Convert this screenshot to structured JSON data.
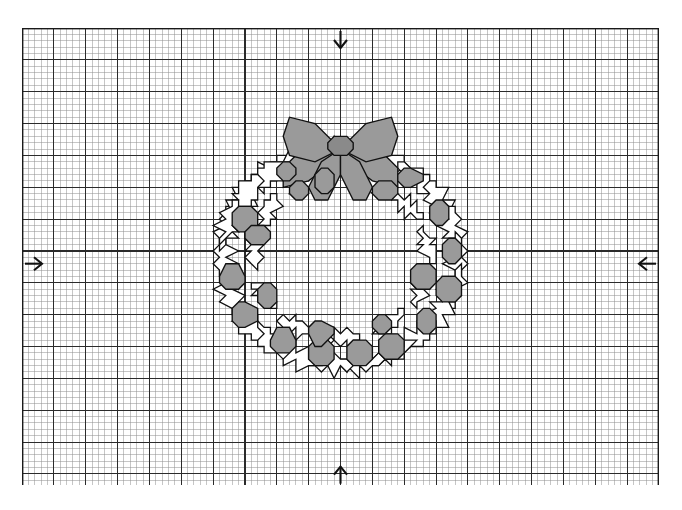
{
  "document": {
    "type": "cross-stitch-chart",
    "title": "Christmas Wreath Cross-Stitch Chart",
    "description": "Counted cross-stitch grid chart showing a holly wreath with a bow at the top and scattered berries."
  },
  "grid": {
    "columns": 100,
    "rows": 72,
    "cell_px": 6.37,
    "major_every": 5,
    "origin_x_px": 22,
    "origin_y_px": 28,
    "minor_color": "#8d8d8d",
    "major_color": "#2b2b2b",
    "border_color": "#1a1a1a",
    "background": "#ffffff",
    "minor_width": 0.5,
    "major_width": 1.1,
    "border_width": 1.4
  },
  "center_markers": [
    {
      "name": "top-center-marker",
      "side": "top",
      "glyph": "arrow-down",
      "col": 50
    },
    {
      "name": "bottom-center-marker",
      "side": "bottom",
      "glyph": "arrow-up",
      "col": 50
    },
    {
      "name": "left-center-marker",
      "side": "left",
      "glyph": "arrow-right",
      "row": 37
    },
    {
      "name": "right-center-marker",
      "side": "right",
      "glyph": "arrow-left",
      "row": 37
    }
  ],
  "palette": {
    "outline": "#111111",
    "fill_gray": "#9a9a9a",
    "fill_gray_dark": "#8a8a8a",
    "fill_white": "#ffffff",
    "paper": "#ffffff"
  },
  "motif": {
    "name": "holly-wreath-with-bow",
    "bounds_cells": {
      "x": 27,
      "y": 15,
      "w": 46,
      "h": 42
    },
    "stitch_unit_px": 6.37,
    "symmetry": "left-right mirrored about column 50",
    "legend_note": "Shaded cells = filled floss colour; outlined cells = second colour / backstitch outline."
  },
  "chart_data": {
    "type": "table",
    "grid_columns": 100,
    "grid_rows": 72,
    "filled_regions": 34,
    "outline_regions": 52,
    "colors_used": 2
  },
  "geometry": {
    "ring": {
      "cx": 50.0,
      "cy": 36.0,
      "outer_rx": 23.2,
      "outer_ry": 21.0,
      "inner_rx": 13.0,
      "inner_ry": 11.2
    },
    "leaves": [
      {
        "a": -96,
        "r": 18.4,
        "s": 5.6,
        "rot": -96,
        "fill": "white"
      },
      {
        "a": -80,
        "r": 18.6,
        "s": 5.2,
        "rot": -80,
        "fill": "white"
      },
      {
        "a": -64,
        "r": 18.4,
        "s": 5.6,
        "rot": -64,
        "fill": "white"
      },
      {
        "a": -48,
        "r": 18.2,
        "s": 5.8,
        "rot": -48,
        "fill": "white"
      },
      {
        "a": -32,
        "r": 18.4,
        "s": 5.6,
        "rot": -32,
        "fill": "white"
      },
      {
        "a": -16,
        "r": 18.4,
        "s": 5.6,
        "rot": -16,
        "fill": "white"
      },
      {
        "a": 0,
        "r": 18.4,
        "s": 5.8,
        "rot": 0,
        "fill": "white"
      },
      {
        "a": 16,
        "r": 18.4,
        "s": 5.6,
        "rot": 16,
        "fill": "white"
      },
      {
        "a": 32,
        "r": 18.4,
        "s": 5.6,
        "rot": 32,
        "fill": "white"
      },
      {
        "a": 48,
        "r": 18.2,
        "s": 5.8,
        "rot": 48,
        "fill": "white"
      },
      {
        "a": 64,
        "r": 18.4,
        "s": 5.6,
        "rot": 64,
        "fill": "white"
      },
      {
        "a": 80,
        "r": 18.6,
        "s": 5.4,
        "rot": 80,
        "fill": "white"
      },
      {
        "a": 96,
        "r": 18.4,
        "s": 5.6,
        "rot": 96,
        "fill": "white"
      },
      {
        "a": 112,
        "r": 18.4,
        "s": 5.6,
        "rot": 112,
        "fill": "white"
      },
      {
        "a": 128,
        "r": 18.2,
        "s": 5.8,
        "rot": 128,
        "fill": "white"
      },
      {
        "a": 144,
        "r": 18.4,
        "s": 5.6,
        "rot": 144,
        "fill": "white"
      },
      {
        "a": 160,
        "r": 18.4,
        "s": 5.6,
        "rot": 160,
        "fill": "white"
      },
      {
        "a": 180,
        "r": 18.4,
        "s": 5.8,
        "rot": 180,
        "fill": "white"
      },
      {
        "a": 196,
        "r": 18.4,
        "s": 5.6,
        "rot": 196,
        "fill": "white"
      },
      {
        "a": 212,
        "r": 18.2,
        "s": 5.8,
        "rot": 212,
        "fill": "white"
      },
      {
        "a": 228,
        "r": 18.4,
        "s": 5.6,
        "rot": 228,
        "fill": "white"
      },
      {
        "a": 244,
        "r": 18.6,
        "s": 5.4,
        "rot": 244,
        "fill": "white"
      },
      {
        "a": 260,
        "r": 18.4,
        "s": 5.6,
        "rot": 260,
        "fill": "white"
      },
      {
        "a": -112,
        "r": 18.4,
        "s": 5.4,
        "rot": -112,
        "fill": "white"
      },
      {
        "a": -128,
        "r": 18.2,
        "s": 5.6,
        "rot": -128,
        "fill": "white"
      },
      {
        "a": -144,
        "r": 18.4,
        "s": 5.6,
        "rot": -144,
        "fill": "white"
      },
      {
        "a": -160,
        "r": 18.4,
        "s": 5.6,
        "rot": -160,
        "fill": "white"
      }
    ],
    "inner_leaves": [
      {
        "a": -72,
        "r": 14.0,
        "s": 4.3,
        "rot": 100,
        "fill": "white"
      },
      {
        "a": -40,
        "r": 13.8,
        "s": 4.3,
        "rot": 130,
        "fill": "white"
      },
      {
        "a": -8,
        "r": 13.8,
        "s": 4.3,
        "rot": 160,
        "fill": "white"
      },
      {
        "a": 24,
        "r": 13.8,
        "s": 4.3,
        "rot": 200,
        "fill": "white"
      },
      {
        "a": 56,
        "r": 13.8,
        "s": 4.3,
        "rot": 230,
        "fill": "white"
      },
      {
        "a": 88,
        "r": 14.0,
        "s": 4.3,
        "rot": 260,
        "fill": "white"
      },
      {
        "a": 120,
        "r": 13.8,
        "s": 4.3,
        "rot": 290,
        "fill": "white"
      },
      {
        "a": 152,
        "r": 13.8,
        "s": 4.3,
        "rot": 320,
        "fill": "white"
      },
      {
        "a": 184,
        "r": 13.8,
        "s": 4.3,
        "rot": 350,
        "fill": "white"
      },
      {
        "a": 216,
        "r": 13.8,
        "s": 4.3,
        "rot": 20,
        "fill": "white"
      },
      {
        "a": 248,
        "r": 14.0,
        "s": 4.3,
        "rot": 50,
        "fill": "white"
      },
      {
        "a": -104,
        "r": 13.8,
        "s": 4.3,
        "rot": 70,
        "fill": "white"
      }
    ],
    "berries": [
      {
        "a": -120,
        "r": 17.2,
        "r2": 2.0
      },
      {
        "a": -100,
        "r": 13.6,
        "r2": 1.9
      },
      {
        "a": -60,
        "r": 13.6,
        "r2": 1.9
      },
      {
        "a": -120,
        "r": 13.2,
        "r2": 1.8
      },
      {
        "a": -156,
        "r": 16.4,
        "r2": 2.0
      },
      {
        "a": 168,
        "r": 17.6,
        "r2": 2.1
      },
      {
        "a": 148,
        "r": 18.2,
        "r2": 2.1
      },
      {
        "a": 122,
        "r": 17.4,
        "r2": 2.2
      },
      {
        "a": 100,
        "r": 17.0,
        "r2": 2.2
      },
      {
        "a": 80,
        "r": 17.2,
        "r2": 2.3
      },
      {
        "a": 62,
        "r": 17.4,
        "r2": 2.2
      },
      {
        "a": 40,
        "r": 17.6,
        "r2": 2.1
      },
      {
        "a": 18,
        "r": 17.8,
        "r2": 2.0
      },
      {
        "a": -4,
        "r": 17.6,
        "r2": 2.0
      },
      {
        "a": -26,
        "r": 17.2,
        "r2": 2.0
      },
      {
        "a": -52,
        "r": 17.4,
        "r2": 2.0
      },
      {
        "a": 14,
        "r": 13.4,
        "r2": 1.8
      },
      {
        "a": 60,
        "r": 13.2,
        "r2": 1.9
      },
      {
        "a": 104,
        "r": 13.4,
        "r2": 1.9
      },
      {
        "a": 150,
        "r": 13.4,
        "r2": 1.8
      },
      {
        "a": 196,
        "r": 13.6,
        "r2": 1.8
      }
    ],
    "bow": {
      "center": {
        "x": 50.0,
        "y": 18.5
      },
      "knot_r": 1.7,
      "left_loop": [
        [
          50,
          18.5
        ],
        [
          46.2,
          14.8
        ],
        [
          42.0,
          14.4
        ],
        [
          40.6,
          17.0
        ],
        [
          42.4,
          20.2
        ],
        [
          46.0,
          21.0
        ]
      ],
      "right_loop": [
        [
          50,
          18.5
        ],
        [
          53.8,
          14.8
        ],
        [
          58.0,
          14.4
        ],
        [
          59.4,
          17.0
        ],
        [
          57.6,
          20.2
        ],
        [
          54.0,
          21.0
        ]
      ],
      "left_tail": [
        [
          50,
          18.5
        ],
        [
          47.2,
          21.4
        ],
        [
          44.6,
          25.0
        ],
        [
          45.6,
          27.4
        ],
        [
          48.4,
          26.6
        ],
        [
          49.6,
          22.6
        ]
      ],
      "right_tail": [
        [
          50,
          18.5
        ],
        [
          52.8,
          21.4
        ],
        [
          55.4,
          25.0
        ],
        [
          54.4,
          27.4
        ],
        [
          51.6,
          26.6
        ],
        [
          50.4,
          22.6
        ]
      ],
      "left_streamer": [
        [
          50,
          18.5
        ],
        [
          44.4,
          19.4
        ],
        [
          40.8,
          21.8
        ],
        [
          41.4,
          24.8
        ],
        [
          45.2,
          24.0
        ],
        [
          48.6,
          20.8
        ]
      ],
      "right_streamer": [
        [
          50,
          18.5
        ],
        [
          55.6,
          19.4
        ],
        [
          59.2,
          21.8
        ],
        [
          58.6,
          24.8
        ],
        [
          54.8,
          24.0
        ],
        [
          51.4,
          20.8
        ]
      ]
    }
  }
}
